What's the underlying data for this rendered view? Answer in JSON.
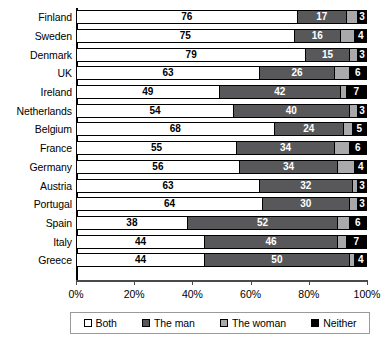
{
  "chart_data": {
    "type": "bar",
    "orientation": "horizontal",
    "stacked": true,
    "stack_mode": "percent",
    "title": "",
    "subtitle": "",
    "xlabel": "",
    "ylabel": "",
    "xlim": [
      0,
      100
    ],
    "xticks": [
      0,
      20,
      40,
      60,
      80,
      100
    ],
    "xtick_labels": [
      "0%",
      "20%",
      "40%",
      "60%",
      "80%",
      "100%"
    ],
    "grid": false,
    "legend_position": "bottom",
    "categories": [
      "Finland",
      "Sweden",
      "Denmark",
      "UK",
      "Ireland",
      "Netherlands",
      "Belgium",
      "France",
      "Germany",
      "Austria",
      "Portugal",
      "Spain",
      "Italy",
      "Greece"
    ],
    "series": [
      {
        "name": "Both",
        "color": "#ffffff",
        "values": [
          76,
          75,
          79,
          63,
          49,
          54,
          68,
          55,
          56,
          63,
          64,
          38,
          44,
          44
        ],
        "labels": [
          "76",
          "75",
          "79",
          "63",
          "49",
          "54",
          "68",
          "55",
          "56",
          "63",
          "64",
          "38",
          "44",
          "44"
        ],
        "labels_shown": true
      },
      {
        "name": "The man",
        "color": "#58585a",
        "values": [
          17,
          16,
          15,
          26,
          42,
          40,
          24,
          34,
          34,
          32,
          30,
          52,
          46,
          50
        ],
        "labels": [
          "17",
          "16",
          "15",
          "26",
          "42",
          "40",
          "24",
          "34",
          "34",
          "32",
          "30",
          "52",
          "46",
          "50"
        ],
        "labels_shown": true
      },
      {
        "name": "The woman",
        "color": "#a9a9ab",
        "values": [
          4,
          5,
          3,
          5,
          2,
          3,
          3,
          5,
          6,
          2,
          3,
          4,
          3,
          2
        ],
        "labels": [
          "",
          "",
          "",
          "",
          "",
          "",
          "",
          "",
          "",
          "",
          "",
          "",
          "",
          ""
        ],
        "labels_shown": false
      },
      {
        "name": "Neither",
        "color": "#000000",
        "values": [
          3,
          4,
          3,
          6,
          7,
          3,
          5,
          6,
          4,
          3,
          3,
          6,
          7,
          4
        ],
        "labels": [
          "3",
          "4",
          "3",
          "6",
          "7",
          "3",
          "5",
          "6",
          "4",
          "3",
          "3",
          "6",
          "7",
          "4"
        ],
        "labels_shown": true
      }
    ]
  },
  "legend": {
    "items": [
      {
        "label": "Both",
        "swatch": "sw-both"
      },
      {
        "label": "The man",
        "swatch": "sw-man"
      },
      {
        "label": "The woman",
        "swatch": "sw-woman"
      },
      {
        "label": "Neither",
        "swatch": "sw-neither"
      }
    ]
  }
}
